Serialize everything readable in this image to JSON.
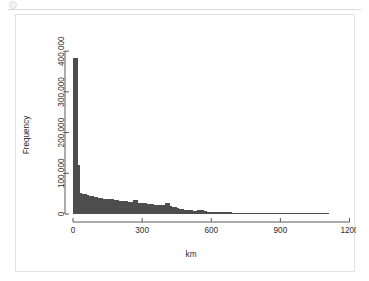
{
  "window": {
    "divider_present": true,
    "dot_icon": "circle-icon"
  },
  "figure": {
    "background_color": "#ffffff",
    "border_color": "#e2e2e2"
  },
  "chart_data": {
    "type": "bar",
    "title": "",
    "subtitle": "",
    "xlabel": "km",
    "ylabel": "Frequency",
    "bar_color": "#4d4d4d",
    "axis_color": "#595959",
    "grid": false,
    "legend": null,
    "xlim": [
      0,
      1150
    ],
    "ylim": [
      0,
      420000
    ],
    "xticks": [
      0,
      300,
      600,
      900,
      1200
    ],
    "xtick_labels": [
      "0",
      "300",
      "600",
      "900",
      "1200"
    ],
    "yticks": [
      0,
      100000,
      200000,
      300000,
      400000
    ],
    "ytick_labels": [
      "0",
      "100,000",
      "200,000",
      "300,000",
      "400,000"
    ],
    "bin_width": 10,
    "bin_starts": [
      0,
      10,
      20,
      30,
      40,
      50,
      60,
      70,
      80,
      90,
      100,
      110,
      120,
      130,
      140,
      150,
      160,
      170,
      180,
      190,
      200,
      210,
      220,
      230,
      240,
      250,
      260,
      270,
      280,
      290,
      300,
      310,
      320,
      330,
      340,
      350,
      360,
      370,
      380,
      390,
      400,
      410,
      420,
      430,
      440,
      450,
      460,
      470,
      480,
      490,
      500,
      510,
      520,
      530,
      540,
      550,
      560,
      570,
      580,
      590,
      600,
      610,
      620,
      630,
      640,
      650,
      660,
      670,
      680,
      690,
      700,
      710,
      720,
      730,
      740,
      750,
      760,
      770,
      780,
      790,
      800,
      810,
      820,
      830,
      840,
      850,
      860,
      870,
      880,
      890,
      900,
      910,
      920,
      930,
      940,
      950,
      960,
      970,
      980,
      990,
      1000,
      1010,
      1020,
      1030,
      1040,
      1050,
      1060,
      1070,
      1080,
      1090,
      1100
    ],
    "values": [
      382000,
      382000,
      120000,
      52000,
      50000,
      48000,
      46000,
      44000,
      43000,
      42000,
      41000,
      40000,
      39000,
      38000,
      38000,
      37000,
      36000,
      36000,
      35000,
      34000,
      33000,
      33000,
      32000,
      31000,
      30000,
      30000,
      35000,
      34000,
      28000,
      27000,
      26000,
      26000,
      25000,
      24000,
      24000,
      23000,
      22000,
      22000,
      21000,
      21000,
      28000,
      27000,
      20000,
      18000,
      16000,
      14000,
      13000,
      12000,
      11000,
      10000,
      9500,
      9000,
      8500,
      8200,
      9500,
      10000,
      9000,
      7000,
      6000,
      5500,
      5000,
      4800,
      4600,
      4400,
      4200,
      4000,
      3900,
      3800,
      3700,
      3600,
      3500,
      3400,
      3300,
      3200,
      3100,
      3000,
      2900,
      2800,
      2700,
      2600,
      2500,
      2400,
      2300,
      2200,
      2100,
      2000,
      1900,
      1800,
      1700,
      1600,
      1500,
      1450,
      1400,
      1350,
      1300,
      1250,
      1200,
      1150,
      1100,
      1050,
      1000,
      950,
      900,
      850,
      800,
      750,
      700,
      650,
      600,
      550,
      500
    ]
  }
}
